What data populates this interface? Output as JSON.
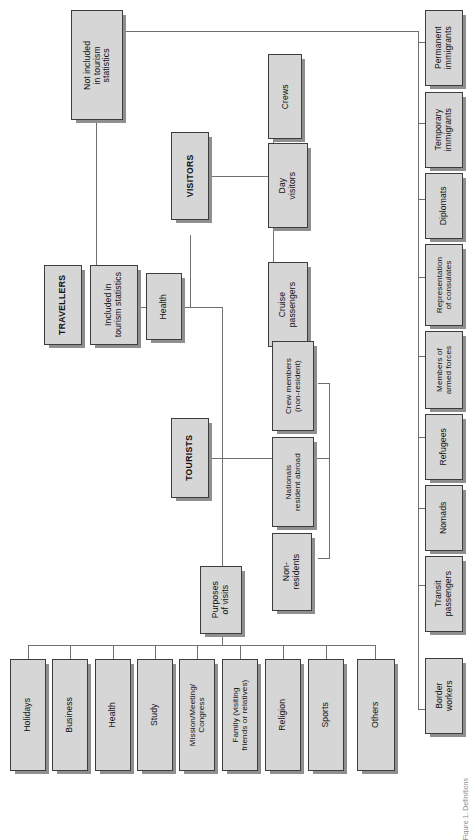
{
  "figure": {
    "caption": "Figure 1. Definitions"
  },
  "colors": {
    "box_fill": "#d6d6d6",
    "box_border": "#3d3d3d",
    "box_shadow": "#8f8f8f",
    "connector": "#6f6f6f",
    "background": "#ffffff"
  },
  "nodes": {
    "travellers": "TRAVELLERS",
    "not_included": "Not included\nin tourism\nstatistics",
    "included": "Included in\ntourism statistics",
    "health_branch": "Health",
    "visitors": "VISITORS",
    "tourists": "TOURISTS",
    "crews": "Crews",
    "day_visitors": "Day\nvisitors",
    "cruise_passengers": "Cruise\npassengers",
    "crew_members": "Crew members\n(non-resident)",
    "nationals_abroad": "Nationals\nresident abroad",
    "non_residents": "Non-\nresidents",
    "purposes": "Purposes\nof visits"
  },
  "purposes_of_visits": [
    "Holidays",
    "Business",
    "Health",
    "Study",
    "Mission/Meeting/\nCongress",
    "Family (visiting\nfriends or relatives)",
    "Religion",
    "Sports",
    "Others"
  ],
  "not_included_categories": [
    "Permanent\nimmigrants",
    "Temporary\nimmigrants",
    "Diplomats",
    "Representation\nof consulates",
    "Members of\narmed forces",
    "Refugees",
    "Nomads",
    "Transit\npassengers",
    "Border\nworkers"
  ]
}
